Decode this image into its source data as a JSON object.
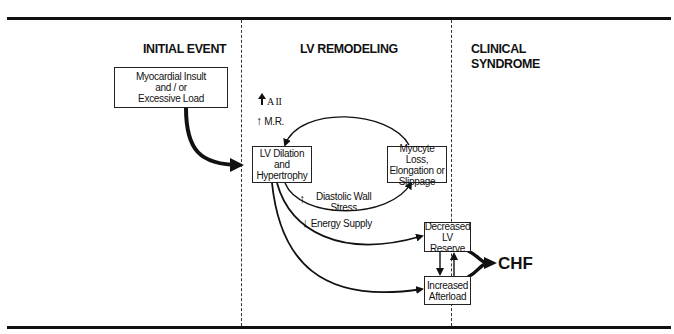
{
  "columns": {
    "initial_event": "INITIAL EVENT",
    "lv_remodeling": "LV REMODELING",
    "clinical_syndrome_line1": "CLINICAL",
    "clinical_syndrome_line2": "SYNDROME"
  },
  "nodes": {
    "insult": {
      "line1": "Myocardial Insult",
      "line2": "and / or",
      "line3": "Excessive Load"
    },
    "dilation": {
      "line1": "LV Dilation",
      "line2": "and",
      "line3": "Hypertrophy"
    },
    "myocyte": {
      "line1": "Myocyte Loss,",
      "line2": "Elongation or",
      "line3": "Slippage"
    },
    "reserve": {
      "line1": "Decreased",
      "line2": "LV Reserve"
    },
    "afterload": {
      "line1": "Increased",
      "line2": "Afterload"
    },
    "chf": "CHF"
  },
  "labels": {
    "a2": "A II",
    "mr": "M.R.",
    "wall_stress_line1": "Diastolic Wall",
    "wall_stress_line2": "Stress",
    "energy": "Energy Supply"
  },
  "arrows": {
    "a2": "up",
    "mr": "up",
    "wall_stress": "up",
    "energy": "down"
  },
  "colors": {
    "ink": "#111111",
    "background": "#ffffff"
  }
}
